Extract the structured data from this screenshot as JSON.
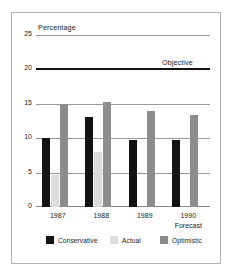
{
  "chart_data": {
    "type": "bar",
    "title": "Percentage",
    "xlabel": "",
    "ylabel": "",
    "categories": [
      "1987",
      "1988",
      "1989",
      "1990"
    ],
    "category_sublabels": [
      "",
      "",
      "",
      "Forecast"
    ],
    "ylim": [
      0,
      27
    ],
    "yticks": [
      0,
      5,
      10,
      15,
      20,
      25
    ],
    "ytick_labels": [
      "0",
      "5",
      "10",
      "15",
      "20",
      "25"
    ],
    "grid": true,
    "legend_position": "bottom",
    "series": [
      {
        "name": "Conservative",
        "color": "#131313",
        "values": [
          10.0,
          13.0,
          9.7,
          9.7
        ]
      },
      {
        "name": "Actual",
        "color": "#dcdcdc",
        "values": [
          4.7,
          8.0,
          0.0,
          0.0
        ]
      },
      {
        "name": "Optimistic",
        "color": "#8d8d8d",
        "values": [
          15.0,
          15.2,
          14.0,
          13.3
        ]
      }
    ],
    "annotations": [
      {
        "name": "objective",
        "label": "Objective",
        "value": 20,
        "color": "#111111",
        "style": "thick-horizontal-line"
      }
    ]
  },
  "legend": {
    "items": [
      {
        "label": "Conservative",
        "color": "#131313"
      },
      {
        "label": "Actual",
        "color": "#dcdcdc"
      },
      {
        "label": "Optimistic",
        "color": "#8d8d8d"
      }
    ]
  }
}
